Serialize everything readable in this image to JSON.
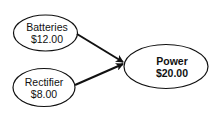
{
  "diagram": {
    "nodes": [
      {
        "id": "batteries",
        "label": "Batteries",
        "value": "$12.00"
      },
      {
        "id": "rectifier",
        "label": "Rectifier",
        "value": "$8.00"
      },
      {
        "id": "power",
        "label": "Power",
        "value": "$20.00"
      }
    ],
    "edges": [
      {
        "from": "batteries",
        "to": "power"
      },
      {
        "from": "rectifier",
        "to": "power"
      }
    ],
    "colors": {
      "stroke": "#111111",
      "fill": "#ffffff",
      "text": "#111111"
    }
  }
}
